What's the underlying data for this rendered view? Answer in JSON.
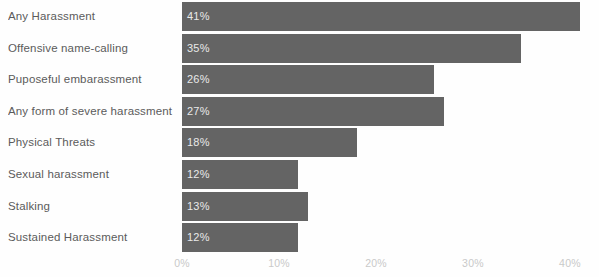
{
  "chart_data": {
    "type": "bar",
    "orientation": "horizontal",
    "title": "",
    "subtitle": "",
    "xlabel": "",
    "ylabel": "",
    "categories": [
      "Any Harassment",
      "Offensive name-calling",
      "Puposeful embarassment",
      "Any form of severe harassment",
      "Physical Threats",
      "Sexual harassment",
      "Stalking",
      "Sustained Harassment"
    ],
    "values": [
      41,
      35,
      26,
      27,
      18,
      12,
      13,
      12
    ],
    "value_labels": [
      "41%",
      "35%",
      "26%",
      "27%",
      "18%",
      "12%",
      "13%",
      "12%"
    ],
    "xlim": [
      0,
      43
    ],
    "xticks": [
      0,
      10,
      20,
      30,
      40
    ],
    "xtick_labels": [
      "0%",
      "10%",
      "20%",
      "30%",
      "40%"
    ],
    "grid": false,
    "legend": null,
    "bar_color": "#646464",
    "value_label_color": "#e9e9e9",
    "category_label_color": "#5b5b5b",
    "tick_label_color": "#c9c9c9",
    "background_color": "#fefefe"
  }
}
